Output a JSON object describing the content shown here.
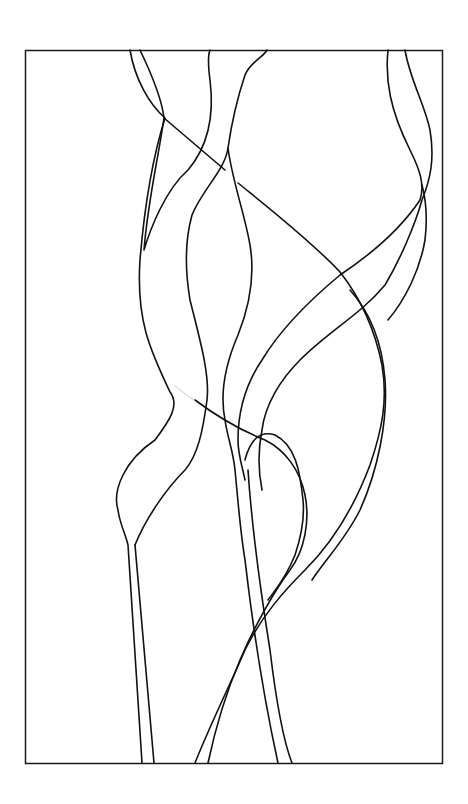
{
  "artwork": {
    "subject": "abstract line drawing of intertwining wavy ribbons in a rectangular frame",
    "colors": {
      "background": "#ffffff",
      "line": "#111111",
      "frame": "#1a1a1a"
    },
    "frame": {
      "x": 25,
      "y": 50,
      "width": 417,
      "height": 713
    }
  }
}
